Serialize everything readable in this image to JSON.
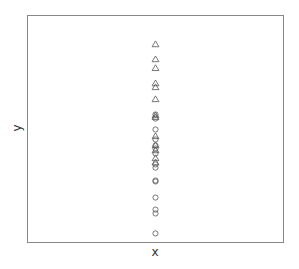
{
  "chart_data": {
    "type": "scatter",
    "title": "",
    "xlabel": "x",
    "ylabel": "y",
    "xlim": [
      0,
      2
    ],
    "ylim": [
      0,
      100
    ],
    "grid": false,
    "legend": "none",
    "series": [
      {
        "name": "group-triangle",
        "marker": "triangle",
        "color": "#555555",
        "x": [
          1,
          1,
          1,
          1,
          1,
          1,
          1,
          1,
          1,
          1,
          1,
          1,
          1
        ],
        "y": [
          87.2,
          80.6,
          76.7,
          70.0,
          68.3,
          63.0,
          55.9,
          55.1,
          46.7,
          42.7,
          40.5,
          37.0,
          35.2
        ]
      },
      {
        "name": "group-circle",
        "marker": "circle",
        "color": "#555555",
        "x": [
          1,
          1,
          1,
          1,
          1,
          1,
          1,
          1,
          1,
          1,
          1,
          1,
          1,
          1,
          1
        ],
        "y": [
          56.4,
          54.6,
          49.8,
          45.4,
          42.7,
          41.4,
          39.2,
          34.4,
          33.0,
          27.3,
          26.9,
          19.8,
          14.5,
          12.8,
          4.0
        ]
      }
    ]
  }
}
